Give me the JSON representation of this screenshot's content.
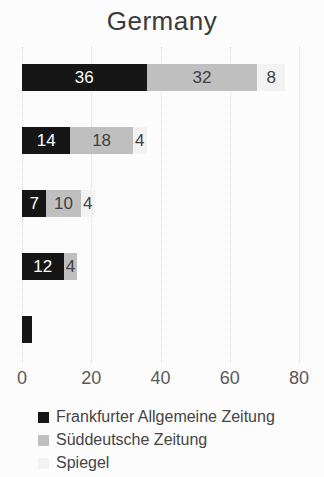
{
  "chart_data": {
    "type": "bar",
    "orientation": "horizontal",
    "stacked": true,
    "title": "Germany",
    "xlabel": "",
    "ylabel": "",
    "xlim": [
      0,
      80
    ],
    "x_ticks": [
      0,
      20,
      40,
      60,
      80
    ],
    "x_tick_labels": [
      "0",
      "20",
      "40",
      "60",
      "80"
    ],
    "grid": "vertical-dotted",
    "gridline_color": "#d6d6d6",
    "legend_position": "bottom-left",
    "categories": [
      "",
      "",
      "",
      "",
      ""
    ],
    "series": [
      {
        "name": "Frankfurter Allgemeine Zeitung",
        "color": "#161616",
        "label_color": "#ffffff",
        "values": [
          36,
          14,
          7,
          12,
          3
        ],
        "labels": [
          "36",
          "14",
          "7",
          "12",
          ""
        ]
      },
      {
        "name": "Süddeutsche Zeitung",
        "color": "#bfbfbf",
        "label_color": "#404040",
        "values": [
          32,
          18,
          10,
          4,
          0
        ],
        "labels": [
          "32",
          "18",
          "10",
          "4",
          ""
        ]
      },
      {
        "name": "Spiegel",
        "color": "#f2f2f2",
        "label_color": "#404040",
        "values": [
          8,
          4,
          4,
          0,
          0
        ],
        "labels": [
          "8",
          "4",
          "4",
          "",
          ""
        ]
      }
    ]
  },
  "title_color": "#3a3a3a",
  "tick_color": "#595959"
}
